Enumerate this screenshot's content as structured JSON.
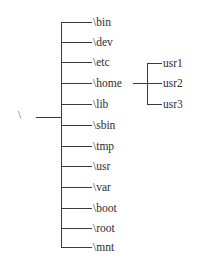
{
  "diagram": {
    "type": "directory-tree",
    "root": {
      "label": "\\"
    },
    "children": [
      {
        "label": "\\bin"
      },
      {
        "label": "\\dev"
      },
      {
        "label": "\\etc"
      },
      {
        "label": "\\home",
        "children": [
          {
            "label": "usr1"
          },
          {
            "label": "usr2"
          },
          {
            "label": "usr3"
          }
        ]
      },
      {
        "label": "\\lib"
      },
      {
        "label": "\\sbin"
      },
      {
        "label": "\\tmp"
      },
      {
        "label": "\\usr"
      },
      {
        "label": "\\var"
      },
      {
        "label": "\\boot"
      },
      {
        "label": "\\root"
      },
      {
        "label": "\\mnt"
      }
    ]
  }
}
